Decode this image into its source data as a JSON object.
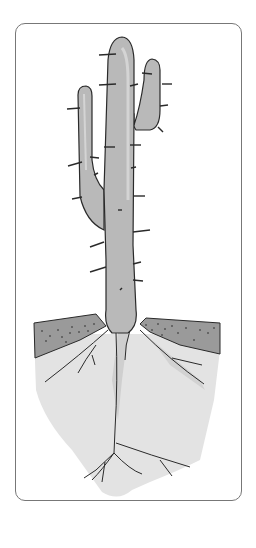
{
  "illustration": {
    "subject": "cactus with root system",
    "parts": [
      "main-stem",
      "left-arm",
      "right-arm",
      "spines",
      "soil-layer",
      "root-zone",
      "roots"
    ],
    "colors": {
      "frame_border": "#777777",
      "cactus_fill": "#b9b9b9",
      "cactus_highlight": "#d4d4d4",
      "outline": "#2a2a2a",
      "soil_fill": "#9a9a9a",
      "soil_dots": "#555555",
      "root_zone_fill": "#e3e3e3",
      "root_shadow": "#cfcfcf"
    }
  }
}
